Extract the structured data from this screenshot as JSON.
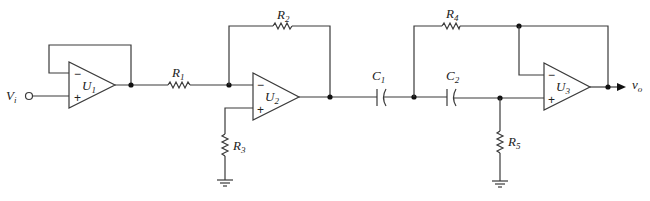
{
  "diagram": {
    "type": "circuit-schematic",
    "input": {
      "label": "V",
      "sub": "i"
    },
    "output": {
      "label": "v",
      "sub": "o"
    },
    "opamps": [
      {
        "id": "U1",
        "label": "U",
        "sub": "1",
        "minus": "−",
        "plus": "+"
      },
      {
        "id": "U2",
        "label": "U",
        "sub": "2",
        "minus": "−",
        "plus": "+"
      },
      {
        "id": "U3",
        "label": "U",
        "sub": "3",
        "minus": "−",
        "plus": "+"
      }
    ],
    "resistors": [
      {
        "id": "R1",
        "label": "R",
        "sub": "1"
      },
      {
        "id": "R2",
        "label": "R",
        "sub": "2"
      },
      {
        "id": "R3",
        "label": "R",
        "sub": "3"
      },
      {
        "id": "R4",
        "label": "R",
        "sub": "4"
      },
      {
        "id": "R5",
        "label": "R",
        "sub": "5"
      }
    ],
    "capacitors": [
      {
        "id": "C1",
        "label": "C",
        "sub": "1"
      },
      {
        "id": "C2",
        "label": "C",
        "sub": "2"
      }
    ],
    "colors": {
      "wire": "#3a3a3a",
      "background": "#ffffff"
    }
  }
}
